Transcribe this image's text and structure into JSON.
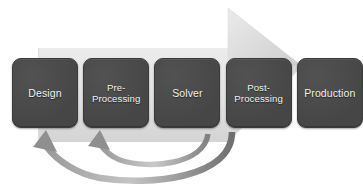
{
  "diagram": {
    "type": "process-flow",
    "colors": {
      "box_fill": "#4a4a4a",
      "box_text": "#f2f2f2",
      "background_arrow": "#e3e3e3",
      "background_arrow_shade": "#cfcfcf",
      "feedback_arrow": "#8c8c8c",
      "canvas": "#ffffff"
    },
    "stages": [
      {
        "id": "design",
        "label": "Design",
        "lines": [
          "Design"
        ],
        "order": 1
      },
      {
        "id": "pre-processing",
        "label": "Pre-\nProcessing",
        "lines": [
          "Pre-",
          "Processing"
        ],
        "order": 2
      },
      {
        "id": "solver",
        "label": "Solver",
        "lines": [
          "Solver"
        ],
        "order": 3
      },
      {
        "id": "post-processing",
        "label": "Post-\nProcessing",
        "lines": [
          "Post-",
          "Processing"
        ],
        "order": 4
      },
      {
        "id": "production",
        "label": "Production",
        "lines": [
          "Production"
        ],
        "order": 5
      }
    ],
    "flow_arrow": {
      "name": "forward-process-arrow",
      "direction": "right",
      "description": "Large light gray block arrow pointing right, spanning all stages"
    },
    "feedback_arrows": [
      {
        "name": "feedback-arrow-post-to-design",
        "from": "post-processing",
        "to": "design",
        "direction": "left"
      },
      {
        "name": "feedback-arrow-solver-to-pre-processing",
        "from": "solver",
        "to": "pre-processing",
        "direction": "left"
      }
    ]
  }
}
